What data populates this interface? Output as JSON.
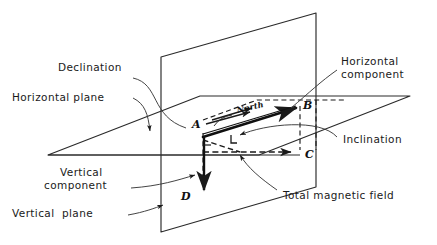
{
  "figure": {
    "background_color": "#ffffff",
    "ink_color": "#1a1a1a",
    "width": 437,
    "height": 245
  },
  "labels": {
    "declination": "Declination",
    "horizontal_plane": "Horizontal plane",
    "horizontal_component_l1": "Horizontal",
    "horizontal_component_l2": "component",
    "inclination": "Inclination",
    "vertical_component_l1": "Vertical",
    "vertical_component_l2": "component",
    "vertical_plane": "Vertical  plane",
    "total_magnetic_field": "Total magnetic field",
    "north": "North"
  },
  "points": {
    "a": "A",
    "b": "B",
    "c": "C",
    "d": "D"
  },
  "geometry": {
    "vertical_plane_corners": "161,57 316,13 316,187 161,232",
    "horizontal_plane_corners": "48,155 200,96 410,96 259,155",
    "point_a": "203,133",
    "point_b": "300,106",
    "point_c": "300,150",
    "point_d": "205,195",
    "total_field_vector": "A to B",
    "vertical_component_vector": "A to D",
    "horizontal_component_vector": "A to C"
  }
}
